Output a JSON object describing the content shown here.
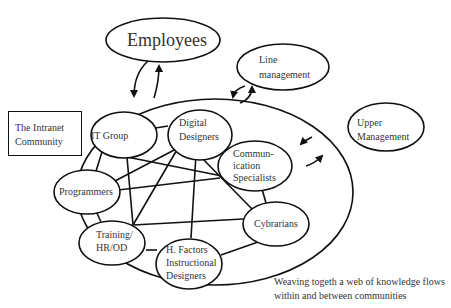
{
  "diagram": {
    "title_node": "Employees",
    "external_nodes": {
      "line_management": [
        "Line",
        "management"
      ],
      "upper_management": [
        "Upper",
        "Management"
      ]
    },
    "community_box": [
      "The Intranet",
      "Community"
    ],
    "community_members": {
      "it_group": "IT Group",
      "digital_designers": [
        "Digital",
        "Designers"
      ],
      "communication_specialists": [
        "Commun-",
        "ication",
        "Specialists"
      ],
      "programmers": "Programmers",
      "cybrarians": "Cybrarians",
      "training": [
        "Training/",
        "HR/OD"
      ],
      "h_factors": [
        "H. Factors",
        "Instructional",
        "Designers"
      ]
    },
    "edges": [
      [
        "IT Group",
        "Digital Designers"
      ],
      [
        "IT Group",
        "Programmers"
      ],
      [
        "IT Group",
        "Communication Specialists"
      ],
      [
        "IT Group",
        "Training/HR/OD"
      ],
      [
        "Digital Designers",
        "Communication Specialists"
      ],
      [
        "Digital Designers",
        "Programmers"
      ],
      [
        "Digital Designers",
        "Training/HR/OD"
      ],
      [
        "Digital Designers",
        "H. Factors Instructional Designers"
      ],
      [
        "Digital Designers",
        "Cybrarians"
      ],
      [
        "Communication Specialists",
        "Programmers"
      ],
      [
        "Communication Specialists",
        "Cybrarians"
      ],
      [
        "Programmers",
        "Training/HR/OD"
      ],
      [
        "Training/HR/OD",
        "Cybrarians"
      ],
      [
        "Training/HR/OD",
        "H. Factors Instructional Designers"
      ],
      [
        "H. Factors Instructional Designers",
        "Cybrarians"
      ]
    ],
    "caption": [
      "Weaving togeth a web of knowledge flows",
      "within and between communities"
    ],
    "colors": {
      "stroke": "#111111",
      "text": "#333333",
      "background": "#ffffff"
    }
  }
}
